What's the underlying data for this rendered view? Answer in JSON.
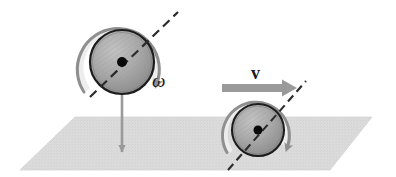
{
  "figure": {
    "background_color": "#ffffff",
    "width": 396,
    "height": 177
  },
  "colors": {
    "ground_plane": "#dcdcdc",
    "ground_plane_edge": "#cfcfcf",
    "wheel_fill_light": "#b4b4b4",
    "wheel_fill_dark": "#8c8c8c",
    "wheel_rim": "#1c1c1c",
    "hub_dot": "#0a0a0a",
    "spin_arrow": "#8f8f8f",
    "spin_arrow_highlight": "#e2e2e2",
    "velocity_arrow": "#9a9a9a",
    "axle_line": "#2b2b2b",
    "drop_arrow": "#9a9a9a",
    "label_color": "#1a1a1a"
  },
  "ground": {
    "name": "ground-plane",
    "shape": "parallelogram",
    "points": "75,117 372,117 330,170 20,170"
  },
  "left_wheel": {
    "name": "left-wheel",
    "center_x": 122,
    "center_y": 62,
    "radius": 32,
    "hub_radius": 5,
    "axle": {
      "label": "axle-axis",
      "x1": 90,
      "y1": 97,
      "x2": 178,
      "y2": 12
    },
    "spin_arrow": {
      "label": "angular-velocity-arc",
      "direction": "clockwise",
      "start_angle_deg": 205,
      "end_angle_deg": 20,
      "radius": 40
    },
    "drop_arrow": {
      "label": "downward-velocity-arrow",
      "x": 122,
      "y_start": 66,
      "y_end": 160
    },
    "symbol": {
      "text": "ω",
      "name": "omega-label",
      "x": 152,
      "y": 86,
      "font_size": 19
    }
  },
  "right_wheel": {
    "name": "right-wheel",
    "center_x": 258,
    "center_y": 130,
    "radius": 26,
    "hub_radius": 4.5,
    "axle": {
      "label": "axle-axis",
      "x1": 228,
      "y1": 170,
      "x2": 306,
      "y2": 81
    },
    "spin_arrow": {
      "label": "angular-velocity-arc",
      "direction": "clockwise",
      "start_angle_deg": 200,
      "end_angle_deg": 25,
      "radius": 33
    },
    "velocity_arrow": {
      "label": "translational-velocity-arrow",
      "x_start": 222,
      "x_end": 297,
      "y": 88,
      "shaft_thickness": 8
    },
    "symbol": {
      "text": "v",
      "name": "velocity-label",
      "x": 256,
      "y": 78,
      "font_size": 18
    }
  },
  "labels": {
    "omega": "ω",
    "velocity": "v"
  }
}
